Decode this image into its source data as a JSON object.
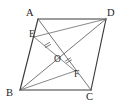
{
  "figure": {
    "kind": "geometry-diagram",
    "shape": "parallelogram",
    "background_color": "#ffffff",
    "stroke_color": "#3a3a3a",
    "inner_stroke_color": "#6a6a6a",
    "label_color": "#1e1e1e",
    "width": 124,
    "height": 104
  },
  "points": {
    "A": {
      "label": "A",
      "x": 38,
      "y": 19,
      "label_x": 26,
      "label_y": 16
    },
    "B": {
      "label": "B",
      "x": 20,
      "y": 90,
      "label_x": 7,
      "label_y": 95
    },
    "C": {
      "label": "C",
      "x": 91,
      "y": 90,
      "label_x": 88,
      "label_y": 98
    },
    "D": {
      "label": "D",
      "x": 106,
      "y": 19,
      "label_x": 107,
      "label_y": 16
    },
    "E": {
      "label": "E",
      "x": 34,
      "y": 37,
      "label_x": 31,
      "label_y": 36
    },
    "O": {
      "label": "O",
      "x": 60,
      "y": 57,
      "label_x": 56,
      "label_y": 62
    },
    "F": {
      "label": "F",
      "x": 75,
      "y": 71,
      "label_x": 75,
      "label_y": 76
    }
  },
  "segments": [
    {
      "name": "side-AB",
      "from": "A",
      "to": "B",
      "style": "edge"
    },
    {
      "name": "side-BC",
      "from": "B",
      "to": "C",
      "style": "edge"
    },
    {
      "name": "side-CD",
      "from": "C",
      "to": "D",
      "style": "edge"
    },
    {
      "name": "side-DA",
      "from": "D",
      "to": "A",
      "style": "edge"
    },
    {
      "name": "diagonal-AC",
      "from": "A",
      "to": "C",
      "style": "diagonal"
    },
    {
      "name": "diagonal-BD",
      "from": "B",
      "to": "D",
      "style": "diagonal"
    },
    {
      "name": "segment-ED",
      "from": "E",
      "to": "D",
      "style": "cevian"
    },
    {
      "name": "segment-BF",
      "from": "B",
      "to": "F",
      "style": "cevian"
    },
    {
      "name": "segment-EF",
      "from": "E",
      "to": "F",
      "style": "cevian"
    }
  ],
  "tick_marks": [
    {
      "name": "tick-EO",
      "on": "segment-EO",
      "x": 47,
      "y": 46,
      "count": 1
    },
    {
      "name": "tick-OF",
      "on": "segment-OF",
      "x": 68,
      "y": 62,
      "count": 1
    }
  ],
  "labels": {
    "A": "A",
    "B": "B",
    "C": "C",
    "D": "D",
    "E": "E",
    "O": "O",
    "F": "F"
  }
}
